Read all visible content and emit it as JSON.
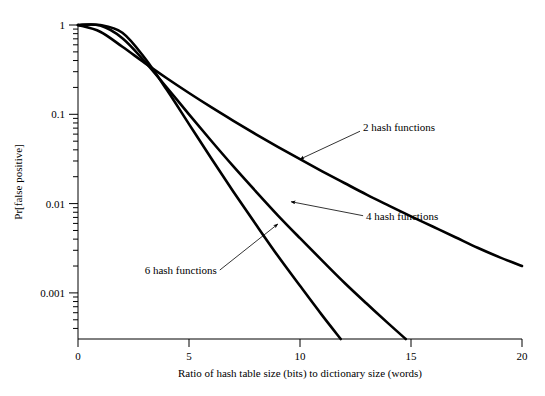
{
  "chart_data": {
    "type": "line",
    "title": "",
    "xlabel": "Ratio of hash table size (bits) to dictionary size (words)",
    "ylabel": "Pr[false positive]",
    "xlim": [
      0,
      20
    ],
    "ylim": [
      0.0002,
      1
    ],
    "yscale": "log",
    "xscale": "linear",
    "grid": false,
    "legend_position": "inline-annotations",
    "xticks": [
      0,
      5,
      10,
      15,
      20
    ],
    "xticklabels": [
      "0",
      "5",
      "10",
      "15",
      "20"
    ],
    "yticks": [
      1,
      0.1,
      0.01,
      0.001
    ],
    "yticklabels": [
      "1",
      "0.1",
      "0.01",
      "0.001"
    ],
    "yminor_ticks": [
      0.9,
      0.8,
      0.7,
      0.6,
      0.5,
      0.4,
      0.3,
      0.2,
      0.09,
      0.08,
      0.07,
      0.06,
      0.05,
      0.04,
      0.03,
      0.02,
      0.009,
      0.008,
      0.007,
      0.006,
      0.005,
      0.004,
      0.003,
      0.002,
      0.0009,
      0.0008,
      0.0007,
      0.0006,
      0.0005,
      0.0004,
      0.0003
    ],
    "x": [
      0,
      1,
      2,
      3,
      4,
      5,
      6,
      7,
      8,
      9,
      10,
      11,
      12,
      13,
      14,
      15,
      16,
      17,
      18,
      19,
      20
    ],
    "series": [
      {
        "name": "2 hash functions",
        "k": 2,
        "values": [
          1.0,
          0.8404,
          0.5699,
          0.3769,
          0.2533,
          0.1732,
          0.1202,
          0.0846,
          0.0601,
          0.0432,
          0.0314,
          0.023,
          0.017,
          0.0126,
          0.0095,
          0.0072,
          0.0055,
          0.0042,
          0.0032,
          0.0025,
          0.002
        ]
      },
      {
        "name": "4 hash functions",
        "k": 4,
        "values": [
          1.0,
          0.9846,
          0.7115,
          0.3922,
          0.1995,
          0.0999,
          0.0506,
          0.0261,
          0.0138,
          0.0074,
          0.0041,
          0.0023,
          0.0013,
          0.00076,
          0.00045,
          0.00027,
          0.00017,
          0.0001,
          6.5e-05,
          4.2e-05,
          2.7e-05
        ]
      },
      {
        "name": "6 hash functions",
        "k": 6,
        "values": [
          1.0,
          0.9993,
          0.8192,
          0.4295,
          0.1879,
          0.0777,
          0.0322,
          0.0136,
          0.0059,
          0.0026,
          0.0012,
          0.00056,
          0.00027,
          0.00013,
          6.5e-05,
          3.4e-05,
          1.8e-05,
          9.4e-06,
          5.1e-06,
          2.8e-06,
          1.6e-06
        ]
      }
    ],
    "annotations": [
      {
        "text": "2 hash functions",
        "curve": "2 hash functions",
        "x": 10.0,
        "y": 0.0314
      },
      {
        "text": "4 hash functions",
        "curve": "4 hash functions",
        "x": 9.6,
        "y": 0.0105
      },
      {
        "text": "6 hash functions",
        "curve": "6 hash functions",
        "x": 9.0,
        "y": 0.0059
      }
    ]
  }
}
